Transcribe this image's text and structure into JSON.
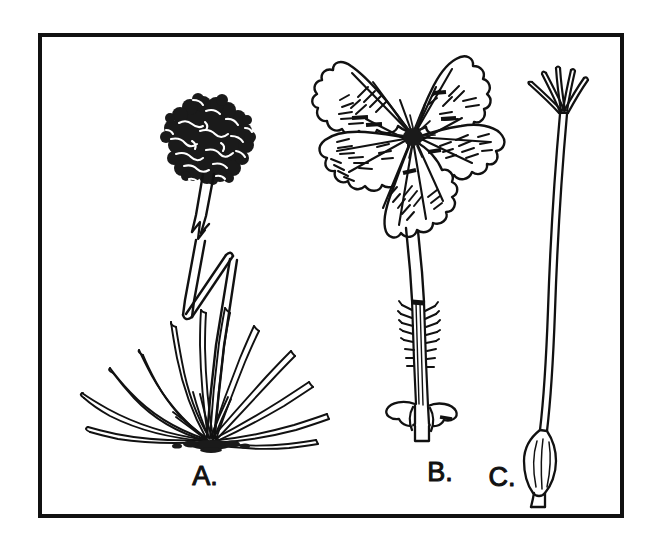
{
  "figure": {
    "type": "botanical-line-illustration",
    "background_color": "#ffffff",
    "ink_color": "#111111",
    "border": {
      "present": true,
      "color": "#111111",
      "thickness_px": 4,
      "x": 38,
      "y": 33,
      "width": 586,
      "height": 485
    },
    "panels": [
      {
        "id": "A",
        "label": "A.",
        "label_x": 205,
        "label_y": 485,
        "subject": "whole plant with basal grass-like leaf rosette and globular flower head on a long bent scape",
        "parts": [
          "globular-flower-head",
          "zigzag-scape",
          "basal-leaf-rosette",
          "root-crown"
        ],
        "leaf_count": 17
      },
      {
        "id": "B",
        "label": "B.",
        "label_x": 440,
        "label_y": 481,
        "subject": "single five-petaled flower with long hairy calyx tube and basal bracts",
        "parts": [
          "five-petals",
          "radiating-veins",
          "hatching-shading",
          "dark-center",
          "calyx-tube",
          "bristly-hairs",
          "basal-bracts"
        ],
        "petal_count": 5
      },
      {
        "id": "C",
        "label": "C.",
        "label_x": 502,
        "label_y": 486,
        "subject": "pistil with ovary at base, long slender style and five spreading stigma branches",
        "parts": [
          "ovary",
          "style",
          "stigma-branches"
        ],
        "stigma_count": 5
      }
    ],
    "labels": [
      {
        "text": "A.",
        "x": 205,
        "y": 485
      },
      {
        "text": "B.",
        "x": 440,
        "y": 481
      },
      {
        "text": "C.",
        "x": 502,
        "y": 486
      }
    ]
  }
}
